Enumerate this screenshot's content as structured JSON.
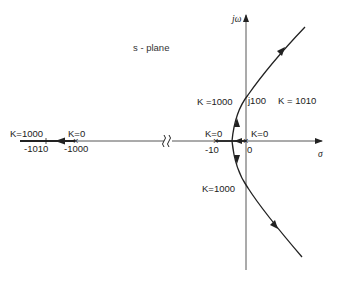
{
  "diagram": {
    "type": "root-locus",
    "plane_label": "s - plane",
    "axes": {
      "imag_label": "jω",
      "real_label": "σ"
    },
    "poles": [
      {
        "value": "0",
        "gain_label": "K=0"
      },
      {
        "value": "-10",
        "gain_label": "K=0"
      },
      {
        "value": "-1000",
        "gain_label": "K=0"
      }
    ],
    "real_axis_branch": {
      "end_value": "-1010",
      "gain_label": "K=1000"
    },
    "crossings": {
      "upper": {
        "value": "j100",
        "gain_label_left": "K =1000",
        "gain_label_right": "K = 1010"
      },
      "lower": {
        "gain_label": "K=1000"
      }
    },
    "axis_break_symbol": "≀≀",
    "colors": {
      "stroke": "#222222",
      "background": "#ffffff"
    }
  }
}
